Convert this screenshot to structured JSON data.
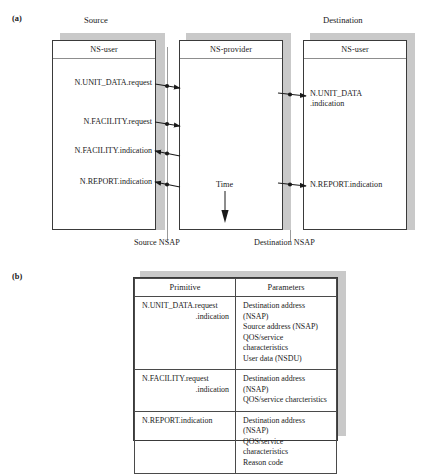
{
  "figure": {
    "panel_a": {
      "letter": "(a)",
      "captions": {
        "source": "Source",
        "destination": "Destination"
      },
      "boxes": [
        {
          "id": "source-ns-user",
          "header": "NS-user"
        },
        {
          "id": "ns-provider",
          "header": "NS-provider"
        },
        {
          "id": "destination-ns-user",
          "header": "NS-user"
        }
      ],
      "time_label": "Time",
      "nsap_labels": {
        "source": "Source NSAP",
        "destination": "Destination NSAP"
      },
      "source_messages": [
        {
          "text": "N.UNIT_DATA.request",
          "direction": "out"
        },
        {
          "text": "N.FACILITY.request",
          "direction": "out"
        },
        {
          "text": "N.FACILITY.indication",
          "direction": "in"
        },
        {
          "text": "N.REPORT.indication",
          "direction": "in"
        }
      ],
      "destination_messages": [
        {
          "line1": "N.UNIT_DATA",
          "line2": ".indication",
          "direction": "in"
        },
        {
          "line1": "N.REPORT.indication",
          "line2": "",
          "direction": "in"
        }
      ]
    },
    "panel_b": {
      "letter": "(b)",
      "table": {
        "headers": [
          "Primitive",
          "Parameters"
        ],
        "rows": [
          {
            "primitive_line1": "N.UNIT_DATA.request",
            "primitive_line2": ".indication",
            "parameters": [
              "Destination address (NSAP)",
              "Source address (NSAP)",
              "QOS/service characteristics",
              "User data (NSDU)"
            ]
          },
          {
            "primitive_line1": "N.FACILITY.request",
            "primitive_line2": ".indication",
            "parameters": [
              "Destination address (NSAP)",
              "QOS/service charcteristics"
            ]
          },
          {
            "primitive_line1": "N.REPORT.indication",
            "primitive_line2": "",
            "parameters": [
              "Destination address (NSAP)",
              "QOS/service characteristics",
              "Reason code"
            ]
          }
        ]
      }
    }
  },
  "colors": {
    "line": "#3a3a3a",
    "shadow": "#c9c9c9",
    "rule": "#8d8d8d",
    "nsap_line": "#9a9a9a",
    "background": "#ffffff"
  }
}
